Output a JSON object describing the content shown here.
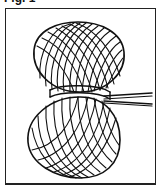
{
  "figure": {
    "caption": "Fig. 1",
    "colors": {
      "line": "#111111",
      "background": "#ffffff",
      "frame": "#222222"
    }
  }
}
